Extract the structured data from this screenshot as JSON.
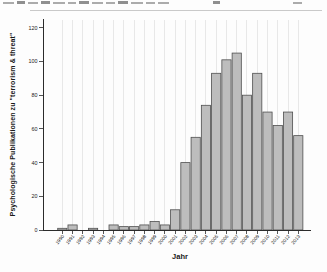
{
  "figure": {
    "x_axis_title": "Jahr",
    "y_axis_title": "Psychologische Publikationen zu \"terrorism & threat\""
  },
  "chart_data": {
    "type": "bar",
    "title": "",
    "xlabel": "Jahr",
    "ylabel": "Psychologische Publikationen zu \"terrorism & threat\"",
    "categories": [
      "1990",
      "1991",
      "1992",
      "1993",
      "1994",
      "1995",
      "1996",
      "1997",
      "1998",
      "1999",
      "2000",
      "2001",
      "2002",
      "2003",
      "2004",
      "2005",
      "2006",
      "2007",
      "2008",
      "2009",
      "2010",
      "2011",
      "2012",
      "2013"
    ],
    "values": [
      1,
      3,
      0,
      1,
      0,
      3,
      2,
      2,
      3,
      5,
      3,
      12,
      40,
      55,
      74,
      93,
      101,
      105,
      80,
      93,
      70,
      62,
      70,
      56
    ],
    "ylim": [
      0,
      120
    ],
    "yticks": [
      0,
      20,
      40,
      60,
      80,
      100,
      120
    ],
    "grid": "faint-vertical-gridlines",
    "legend": "none",
    "bar_fill": "#bdbdbd",
    "bar_stroke": "#4f4f4f",
    "axis_color": "#2b2b2b",
    "gridline_color": "#e8e8e8",
    "tick_label_color": "#222222"
  }
}
